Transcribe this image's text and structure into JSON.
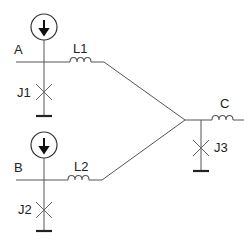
{
  "diagram": {
    "type": "superconducting circuit schematic",
    "nodes": {
      "A": {
        "label": "A"
      },
      "B": {
        "label": "B"
      },
      "C": {
        "label": "C"
      }
    },
    "inductors": [
      {
        "label": "L1"
      },
      {
        "label": "L2"
      },
      {
        "label": "L3",
        "visible_label": false
      }
    ],
    "junctions": [
      {
        "label": "J1"
      },
      {
        "label": "J2"
      },
      {
        "label": "J3"
      }
    ],
    "current_sources": [
      {
        "node": "A",
        "icon": "current-source-down-arrow-icon"
      },
      {
        "node": "B",
        "icon": "current-source-down-arrow-icon"
      }
    ],
    "colors": {
      "wire": "#555555",
      "ground": "#222222",
      "text": "#222222"
    }
  }
}
